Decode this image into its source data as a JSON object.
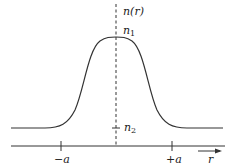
{
  "diagram": {
    "axis_label": "r",
    "function_label": "n(r)",
    "peak_label": "n",
    "peak_subscript": "1",
    "base_label": "n",
    "base_subscript": "2",
    "tick_left": "−a",
    "tick_right": "+a",
    "colors": {
      "line": "#333333",
      "background": "#ffffff"
    }
  }
}
